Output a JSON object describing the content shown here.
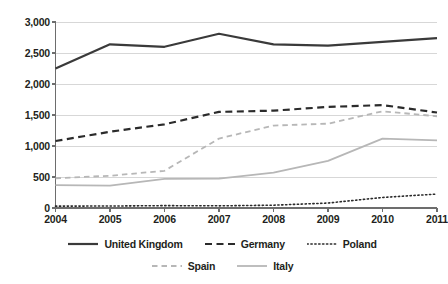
{
  "chart_data": {
    "type": "line",
    "title": "",
    "subtitle": "",
    "xlabel": "",
    "ylabel": "",
    "x": [
      2004,
      2005,
      2006,
      2007,
      2008,
      2009,
      2010,
      2011
    ],
    "categories": [
      "2004",
      "2005",
      "2006",
      "2007",
      "2008",
      "2009",
      "2010",
      "2011"
    ],
    "xlim": [
      2004,
      2011
    ],
    "ylim": [
      0,
      3000
    ],
    "yticks": [
      0,
      500,
      1000,
      1500,
      2000,
      2500,
      3000
    ],
    "ytick_labels": [
      "0",
      "500",
      "1,000",
      "1,500",
      "2,000",
      "2,500",
      "3,000"
    ],
    "grid": "horizontal",
    "legend_position": "bottom",
    "series": [
      {
        "name": "United Kingdom",
        "style": "solid",
        "color": "#3a3a3a",
        "width": 2.2,
        "values": [
          2250,
          2640,
          2600,
          2810,
          2640,
          2620,
          2680,
          2740
        ]
      },
      {
        "name": "Germany",
        "style": "dashed",
        "color": "#2b2b2b",
        "width": 2.2,
        "values": [
          1080,
          1230,
          1350,
          1550,
          1570,
          1630,
          1660,
          1540
        ]
      },
      {
        "name": "Poland",
        "style": "dotted",
        "color": "#2b2b2b",
        "width": 1.6,
        "values": [
          30,
          32,
          38,
          35,
          45,
          80,
          170,
          225
        ]
      },
      {
        "name": "Spain",
        "style": "dashed",
        "color": "#b7b7b7",
        "width": 1.8,
        "values": [
          480,
          520,
          600,
          1120,
          1330,
          1360,
          1560,
          1480
        ]
      },
      {
        "name": "Italy",
        "style": "solid",
        "color": "#b7b7b7",
        "width": 1.8,
        "values": [
          370,
          360,
          470,
          475,
          570,
          760,
          1120,
          1090
        ]
      }
    ]
  },
  "legend": {
    "rows": [
      [
        {
          "label": "United Kingdom",
          "series": 0
        },
        {
          "label": "Germany",
          "series": 1
        },
        {
          "label": "Poland",
          "series": 2
        }
      ],
      [
        {
          "label": "Spain",
          "series": 3
        },
        {
          "label": "Italy",
          "series": 4
        }
      ]
    ]
  },
  "axes": {
    "grid_color": "#d7d7d7",
    "axis_color": "#6d6d6d"
  }
}
